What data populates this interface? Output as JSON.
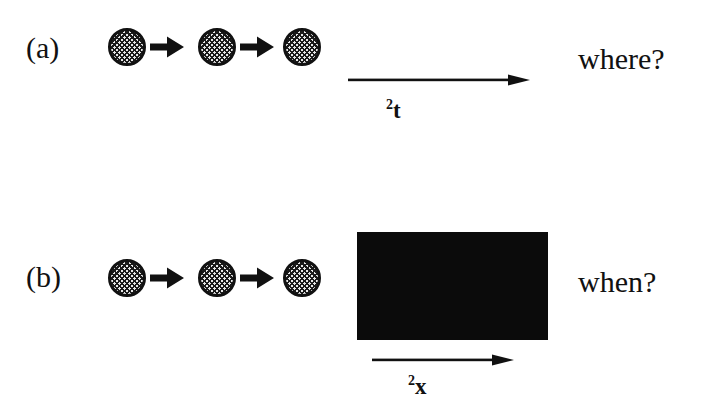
{
  "figure": {
    "width": 707,
    "height": 409,
    "background_color": "#ffffff",
    "ink_color": "#111111"
  },
  "panels": [
    {
      "id": "a",
      "label": "(a)",
      "particle_chain": {
        "particle_count": 3,
        "arrow_count": 2,
        "particle_icon": "hatched-circle-icon",
        "arrow_icon": "block-arrow-right-icon",
        "particles_x": [
          108,
          198,
          283
        ],
        "particles_y": 28,
        "particle_diameter": 38
      },
      "axis": {
        "arrow_icon": "long-arrow-right-icon",
        "label_superscript": "2",
        "label_base": "t",
        "label_full": "2t",
        "x_start": 348,
        "x_end": 528,
        "y": 80
      },
      "question": "where?"
    },
    {
      "id": "b",
      "label": "(b)",
      "particle_chain": {
        "particle_count": 3,
        "arrow_count": 2,
        "particle_icon": "hatched-circle-icon",
        "arrow_icon": "block-arrow-right-icon",
        "particles_x": [
          108,
          198,
          283
        ],
        "particles_y": 259,
        "particle_diameter": 38
      },
      "black_block": {
        "name": "solid-black-rectangle",
        "color": "#0b0b0b",
        "x": 357,
        "y": 232,
        "width": 191,
        "height": 108
      },
      "axis": {
        "arrow_icon": "long-arrow-right-icon",
        "label_superscript": "2",
        "label_base": "x",
        "label_full": "2x",
        "x_start": 372,
        "x_end": 512,
        "y": 360
      },
      "question": "when?"
    }
  ]
}
